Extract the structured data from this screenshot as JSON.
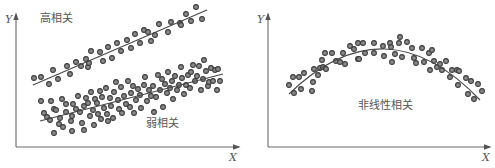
{
  "figure": {
    "panels": [
      {
        "id": "left",
        "y_axis_label": "Y",
        "x_axis_label": "X",
        "annotations": [
          "高相关",
          "弱相关"
        ]
      },
      {
        "id": "right",
        "y_axis_label": "Y",
        "x_axis_label": "X",
        "annotations": [
          "非线性相关"
        ]
      }
    ]
  },
  "chart_data": [
    {
      "type": "scatter",
      "title": "",
      "xlabel": "X",
      "ylabel": "Y",
      "grid": false,
      "legend": "none",
      "series": [
        {
          "name": "高相关",
          "fit": "linear",
          "fit_line": [
            [
              33,
              85
            ],
            [
              207,
              10
            ]
          ],
          "points": [
            [
              34,
              78
            ],
            [
              41,
              77
            ],
            [
              53,
              70
            ],
            [
              49,
              84
            ],
            [
              58,
              79
            ],
            [
              67,
              66
            ],
            [
              70,
              74
            ],
            [
              76,
              62
            ],
            [
              81,
              66
            ],
            [
              86,
              59
            ],
            [
              88,
              67
            ],
            [
              89,
              63
            ],
            [
              91,
              51
            ],
            [
              100,
              52
            ],
            [
              103,
              61
            ],
            [
              108,
              47
            ],
            [
              112,
              58
            ],
            [
              117,
              43
            ],
            [
              121,
              51
            ],
            [
              127,
              40
            ],
            [
              131,
              48
            ],
            [
              135,
              34
            ],
            [
              140,
              43
            ],
            [
              144,
              30
            ],
            [
              148,
              32
            ],
            [
              151,
              41
            ],
            [
              155,
              35
            ],
            [
              159,
              24
            ],
            [
              168,
              32
            ],
            [
              171,
              22
            ],
            [
              180,
              23
            ],
            [
              181,
              25
            ],
            [
              186,
              14
            ],
            [
              191,
              21
            ],
            [
              196,
              7
            ],
            [
              202,
              19
            ]
          ]
        },
        {
          "name": "弱相关",
          "fit": "linear",
          "fit_line": [
            [
              40,
              121
            ],
            [
              223,
              74
            ]
          ],
          "points": [
            [
              41,
              101
            ],
            [
              44,
              113
            ],
            [
              47,
              117
            ],
            [
              50,
              120
            ],
            [
              51,
              101
            ],
            [
              54,
              109
            ],
            [
              54,
              133
            ],
            [
              56,
              110
            ],
            [
              59,
              124
            ],
            [
              60,
              118
            ],
            [
              62,
              99
            ],
            [
              63,
              127
            ],
            [
              66,
              104
            ],
            [
              66,
              112
            ],
            [
              71,
              121
            ],
            [
              72,
              116
            ],
            [
              72,
              131
            ],
            [
              73,
              104
            ],
            [
              76,
              109
            ],
            [
              78,
              96
            ],
            [
              80,
              112
            ],
            [
              82,
              123
            ],
            [
              84,
              106
            ],
            [
              84,
              130
            ],
            [
              86,
              98
            ],
            [
              88,
              103
            ],
            [
              90,
              116
            ],
            [
              91,
              92
            ],
            [
              93,
              110
            ],
            [
              94,
              125
            ],
            [
              95,
              99
            ],
            [
              97,
              103
            ],
            [
              98,
              114
            ],
            [
              100,
              91
            ],
            [
              101,
              119
            ],
            [
              102,
              97
            ],
            [
              104,
              108
            ],
            [
              106,
              88
            ],
            [
              107,
              114
            ],
            [
              108,
              121
            ],
            [
              110,
              98
            ],
            [
              111,
              106
            ],
            [
              113,
              118
            ],
            [
              114,
              92
            ],
            [
              116,
              82
            ],
            [
              118,
              100
            ],
            [
              119,
              109
            ],
            [
              121,
              87
            ],
            [
              122,
              113
            ],
            [
              124,
              96
            ],
            [
              126,
              104
            ],
            [
              128,
              81
            ],
            [
              130,
              107
            ],
            [
              131,
              93
            ],
            [
              133,
              86
            ],
            [
              134,
              113
            ],
            [
              136,
              100
            ],
            [
              138,
              89
            ],
            [
              140,
              95
            ],
            [
              141,
              108
            ],
            [
              144,
              85
            ],
            [
              145,
              77
            ],
            [
              147,
              101
            ],
            [
              149,
              90
            ],
            [
              151,
              96
            ],
            [
              153,
              86
            ],
            [
              154,
              112
            ],
            [
              156,
              97
            ],
            [
              158,
              75
            ],
            [
              160,
              90
            ],
            [
              162,
              79
            ],
            [
              163,
              107
            ],
            [
              165,
              84
            ],
            [
              167,
              93
            ],
            [
              168,
              72
            ],
            [
              170,
              88
            ],
            [
              172,
              81
            ],
            [
              173,
              99
            ],
            [
              175,
              76
            ],
            [
              177,
              90
            ],
            [
              179,
              85
            ],
            [
              181,
              67
            ],
            [
              182,
              78
            ],
            [
              184,
              94
            ],
            [
              186,
              85
            ],
            [
              188,
              75
            ],
            [
              190,
              88
            ],
            [
              191,
              72
            ],
            [
              193,
              65
            ],
            [
              195,
              81
            ],
            [
              197,
              76
            ],
            [
              199,
              66
            ],
            [
              201,
              90
            ],
            [
              203,
              79
            ],
            [
              204,
              60
            ],
            [
              206,
              71
            ],
            [
              208,
              86
            ],
            [
              209,
              82
            ],
            [
              211,
              68
            ],
            [
              213,
              81
            ],
            [
              215,
              70
            ],
            [
              217,
              90
            ],
            [
              218,
              69
            ],
            [
              220,
              81
            ]
          ]
        }
      ]
    },
    {
      "type": "scatter",
      "title": "",
      "xlabel": "X",
      "ylabel": "Y",
      "grid": false,
      "legend": "none",
      "series": [
        {
          "name": "非线性相关",
          "fit": "quadratic",
          "fit_curve": [
            [
              289,
              94
            ],
            [
              385,
              49
            ],
            [
              480,
              100
            ]
          ],
          "points": [
            [
              289,
              85
            ],
            [
              293,
              77
            ],
            [
              294,
              93
            ],
            [
              299,
              77
            ],
            [
              301,
              89
            ],
            [
              304,
              73
            ],
            [
              312,
              91
            ],
            [
              313,
              82
            ],
            [
              314,
              69
            ],
            [
              318,
              75
            ],
            [
              320,
              68
            ],
            [
              322,
              60
            ],
            [
              323,
              67
            ],
            [
              325,
              53
            ],
            [
              326,
              69
            ],
            [
              332,
              53
            ],
            [
              336,
              61
            ],
            [
              340,
              62
            ],
            [
              343,
              53
            ],
            [
              345,
              64
            ],
            [
              350,
              46
            ],
            [
              354,
              49
            ],
            [
              358,
              43
            ],
            [
              358,
              59
            ],
            [
              359,
              59
            ],
            [
              363,
              43
            ],
            [
              365,
              53
            ],
            [
              374,
              43
            ],
            [
              374,
              53
            ],
            [
              383,
              46
            ],
            [
              384,
              56
            ],
            [
              390,
              43
            ],
            [
              391,
              47
            ],
            [
              392,
              62
            ],
            [
              395,
              54
            ],
            [
              399,
              43
            ],
            [
              400,
              37
            ],
            [
              402,
              57
            ],
            [
              407,
              42
            ],
            [
              412,
              48
            ],
            [
              414,
              58
            ],
            [
              416,
              63
            ],
            [
              422,
              48
            ],
            [
              424,
              62
            ],
            [
              429,
              53
            ],
            [
              430,
              70
            ],
            [
              432,
              50
            ],
            [
              434,
              61
            ],
            [
              437,
              67
            ],
            [
              440,
              64
            ],
            [
              442,
              70
            ],
            [
              446,
              61
            ],
            [
              450,
              77
            ],
            [
              452,
              70
            ],
            [
              457,
              70
            ],
            [
              458,
              85
            ],
            [
              459,
              71
            ],
            [
              466,
              78
            ],
            [
              468,
              94
            ],
            [
              471,
              81
            ],
            [
              474,
              99
            ],
            [
              478,
              84
            ],
            [
              482,
              91
            ]
          ]
        }
      ]
    }
  ]
}
